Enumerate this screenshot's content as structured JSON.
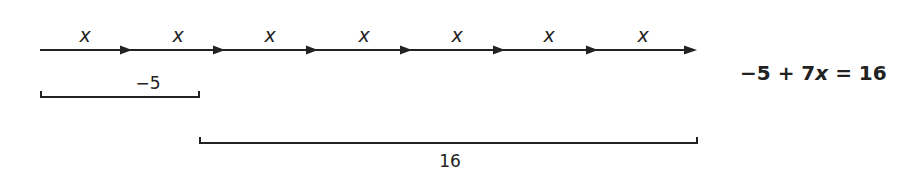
{
  "diagram": {
    "segment_label": "x",
    "segment_count": 7,
    "segments": [
      {
        "label": "x"
      },
      {
        "label": "x"
      },
      {
        "label": "x"
      },
      {
        "label": "x"
      },
      {
        "label": "x"
      },
      {
        "label": "x"
      },
      {
        "label": "x"
      }
    ],
    "bracket_negative": {
      "label": "−5"
    },
    "bracket_total": {
      "label": "16"
    },
    "equation": {
      "left": "−5 + 7",
      "variable": "x",
      "right": " = 16"
    },
    "colors": {
      "stroke": "#222222",
      "background": "#ffffff"
    }
  }
}
